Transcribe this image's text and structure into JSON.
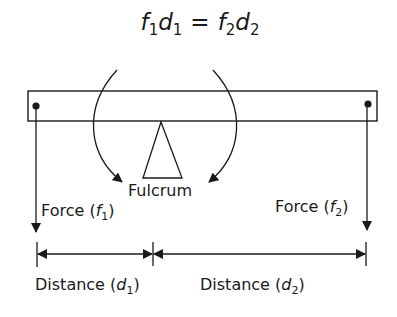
{
  "equation": {
    "f1": "f",
    "f1_sub": "1",
    "d1": "d",
    "d1_sub": "1",
    "equals": "=",
    "f2": "f",
    "f2_sub": "2",
    "d2": "d",
    "d2_sub": "2"
  },
  "labels": {
    "fulcrum": "Fulcrum",
    "force1_prefix": "Force (",
    "force1_var": "f",
    "force1_sub": "1",
    "force1_suffix": ")",
    "force2_prefix": "Force (",
    "force2_var": "f",
    "force2_sub": "2",
    "force2_suffix": ")",
    "distance1_prefix": "Distance (",
    "distance1_var": "d",
    "distance1_sub": "1",
    "distance1_suffix": ")",
    "distance2_prefix": "Distance (",
    "distance2_var": "d",
    "distance2_sub": "2",
    "distance2_suffix": ")"
  },
  "colors": {
    "stroke": "#1a1a1a",
    "background": "#ffffff"
  }
}
